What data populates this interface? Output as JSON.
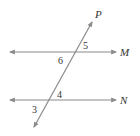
{
  "diagram": {
    "type": "parallel-lines-transversal",
    "colors": {
      "line": "#8a8a8a",
      "text": "#333333",
      "background": "#ffffff"
    },
    "lines": [
      {
        "name": "M",
        "label": "M",
        "x1": 10,
        "y1": 52,
        "x2": 116,
        "y2": 52
      },
      {
        "name": "N",
        "label": "N",
        "x1": 10,
        "y1": 100,
        "x2": 116,
        "y2": 100
      },
      {
        "name": "P",
        "label": "P",
        "x1": 92,
        "y1": 22,
        "x2": 34,
        "y2": 127
      }
    ],
    "angle_labels": [
      {
        "id": "5",
        "text": "5",
        "x": 83,
        "y": 49
      },
      {
        "id": "6",
        "text": "6",
        "x": 58,
        "y": 64
      },
      {
        "id": "4",
        "text": "4",
        "x": 57,
        "y": 98
      },
      {
        "id": "3",
        "text": "3",
        "x": 32,
        "y": 113
      }
    ],
    "line_labels": {
      "P": {
        "text": "P",
        "x": 95,
        "y": 18
      },
      "M": {
        "text": "M",
        "x": 120,
        "y": 56
      },
      "N": {
        "text": "N",
        "x": 120,
        "y": 104
      }
    }
  }
}
